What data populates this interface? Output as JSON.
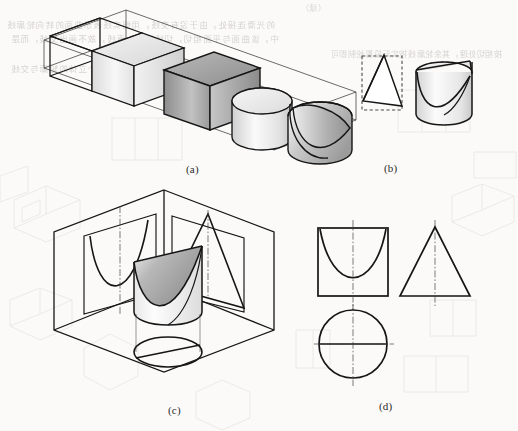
{
  "page": {
    "kind": "scanned-textbook-figure",
    "background_color": "#fbfaf8",
    "ink_color": "#161616",
    "bleed_color": "#b9b4ad"
  },
  "figure": {
    "panels": [
      {
        "id": "a",
        "caption": "(a)",
        "title": "Isometric sequence of solids inside a long transparent prism",
        "description": "Left-to-right progression: open wireframe box, light shaded cube, dark shaded cube, plain cylinder, cylinder with curved (parabolic) cut",
        "items": [
          {
            "name": "wireframe-box",
            "shading": "none"
          },
          {
            "name": "light-cube",
            "shading": "light-gradient"
          },
          {
            "name": "dark-cube",
            "shading": "dark-gradient"
          },
          {
            "name": "cylinder",
            "shading": "light-gradient"
          },
          {
            "name": "cylinder-with-curved-cut",
            "shading": "dark-gradient"
          }
        ]
      },
      {
        "id": "b",
        "caption": "(b)",
        "title": "Two solids with dashed construction outlines",
        "items": [
          {
            "name": "wedge-triangle",
            "outline": "dashed-rectangle"
          },
          {
            "name": "cut-cylinder",
            "outline": "dashed-ellipse-top"
          }
        ]
      },
      {
        "id": "c",
        "caption": "(c)",
        "title": "Cut cylinder shown inside an isometric projection box with three projected views",
        "projections": [
          {
            "plane": "left-vertical",
            "shape": "parabola"
          },
          {
            "plane": "right-vertical",
            "shape": "triangle"
          },
          {
            "plane": "horizontal-bottom",
            "shape": "ellipse-with-chord"
          }
        ]
      },
      {
        "id": "d",
        "caption": "(d)",
        "title": "Three orthographic views of the cut cylinder",
        "views": [
          {
            "name": "front-view",
            "shape": "square-with-parabola",
            "position": "top-left"
          },
          {
            "name": "side-view",
            "shape": "triangle",
            "position": "top-right"
          },
          {
            "name": "top-view",
            "shape": "circle-with-chord",
            "position": "bottom-left"
          }
        ]
      }
    ]
  },
  "bleed_text": {
    "note": "Faint mirrored show-through of Chinese body text from the reverse side of the page",
    "lines": [
      "的光滑连接处，由于没有交线，用细实线表示曲面的转向轮廓线",
      "中，该曲面与平面相切，切线投影为直线，故不画出交线，而是",
      "按相切处理，其余轮廓线按实际投影绘制即可",
      "因此在投影图中只需画出各个立体的轮廓与交线"
    ],
    "header_fragment": "（续）"
  }
}
